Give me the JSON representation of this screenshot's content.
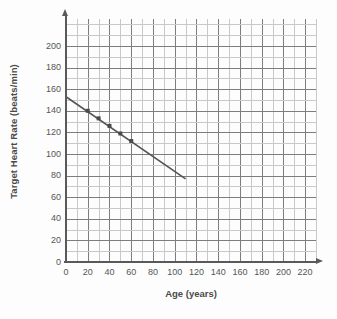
{
  "chart_data": {
    "type": "line",
    "title": "",
    "xlabel": "Age (years)",
    "ylabel": "Target Heart Rate (beats/min)",
    "xlim": [
      0,
      230
    ],
    "ylim": [
      0,
      225
    ],
    "xticks": [
      0,
      20,
      40,
      60,
      80,
      100,
      120,
      140,
      160,
      180,
      200,
      220
    ],
    "yticks": [
      0,
      20,
      40,
      60,
      80,
      100,
      120,
      140,
      160,
      180,
      200
    ],
    "xtick_labels": [
      "0",
      "20",
      "40",
      "60",
      "80",
      "100",
      "120",
      "140",
      "160",
      "180",
      "200",
      "220"
    ],
    "ytick_labels": [
      "0",
      "20",
      "40",
      "60",
      "80",
      "100",
      "120",
      "140",
      "160",
      "180",
      "200"
    ],
    "x_minor_step": 10,
    "y_minor_step": 10,
    "grid": true,
    "legend": null,
    "series": [
      {
        "name": "Target heart rate vs age",
        "type": "line",
        "color": "#555555",
        "line": {
          "x_start": 0,
          "y_start": 153,
          "x_end": 110,
          "y_end": 77,
          "slope": -0.69,
          "intercept": 153
        },
        "x": [
          20,
          30,
          40,
          50,
          60
        ],
        "y": [
          140,
          133,
          126,
          119,
          112
        ],
        "marker": "square",
        "marker_color": "#4a4a4a"
      }
    ]
  },
  "axes": {
    "y_title": "Target Heart Rate (beats/min)",
    "x_title": "Age (years)"
  },
  "colors": {
    "grid_major": "#7d7d7d",
    "grid_minor": "#c9c9c9",
    "axis": "#5a5a5a",
    "data_line": "#555555",
    "background": "#fdfdfd"
  }
}
